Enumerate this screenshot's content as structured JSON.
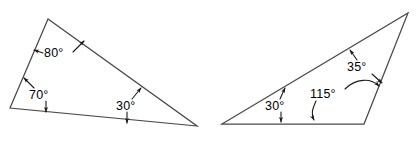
{
  "figure": {
    "background_color": "#ffffff",
    "stroke_color": "#4a4a4a",
    "label_color": "#000000",
    "width": 417,
    "height": 141,
    "shapes": [
      {
        "name": "left-triangle",
        "vertices": [
          [
            48,
            19
          ],
          [
            10,
            108
          ],
          [
            197,
            126
          ]
        ],
        "angle_labels": [
          {
            "id": "left-angle-80",
            "text": "80°",
            "value": 80,
            "vertex": "top",
            "x": 44,
            "y": 57
          },
          {
            "id": "left-angle-70",
            "text": "70°",
            "value": 70,
            "vertex": "bottom-left",
            "x": 29,
            "y": 99
          },
          {
            "id": "left-angle-30",
            "text": "30°",
            "value": 30,
            "vertex": "bottom-right",
            "x": 116,
            "y": 110
          }
        ],
        "angle_sum": 180
      },
      {
        "name": "right-triangle",
        "vertices": [
          [
            222,
            124
          ],
          [
            408,
            13
          ],
          [
            364,
            124
          ]
        ],
        "angle_labels": [
          {
            "id": "right-angle-30",
            "text": "30°",
            "value": 30,
            "vertex": "bottom-left",
            "x": 265,
            "y": 110
          },
          {
            "id": "right-angle-35",
            "text": "35°",
            "value": 35,
            "vertex": "apex",
            "x": 347,
            "y": 71
          },
          {
            "id": "right-angle-115",
            "text": "115°",
            "value": 115,
            "vertex": "bottom-right",
            "x": 310,
            "y": 98
          }
        ],
        "angle_sum": 180
      }
    ]
  }
}
